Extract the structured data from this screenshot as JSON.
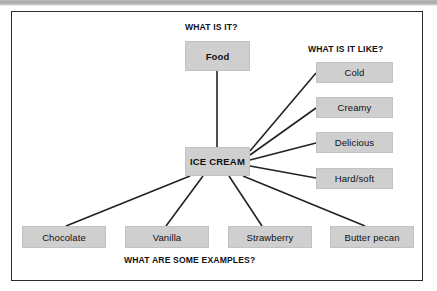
{
  "diagram": {
    "type": "concept-map",
    "title_node": "ICE CREAM",
    "headings": {
      "what_is_it": "WHAT IS IT?",
      "what_is_it_like": "WHAT IS IT LIKE?",
      "what_are_some_examples": "WHAT ARE SOME EXAMPLES?"
    },
    "center": {
      "label": "ICE CREAM"
    },
    "category_nodes": [
      {
        "label": "Food"
      }
    ],
    "property_nodes": [
      {
        "label": "Cold"
      },
      {
        "label": "Creamy"
      },
      {
        "label": "Delicious"
      },
      {
        "label": "Hard/soft"
      }
    ],
    "example_nodes": [
      {
        "label": "Chocolate"
      },
      {
        "label": "Vanilla"
      },
      {
        "label": "Strawberry"
      },
      {
        "label": "Butter pecan"
      }
    ],
    "colors": {
      "node_fill": "#cfcfcf",
      "node_border": "#c2c2c2",
      "frame_border": "#2b2b2b",
      "connector": "#222222",
      "text": "#111111",
      "background": "#ffffff"
    }
  }
}
